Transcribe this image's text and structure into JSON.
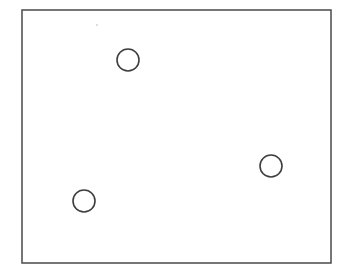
{
  "figure": {
    "name": "rectangle-with-three-circles",
    "canvas": {
      "width": 348,
      "height": 276,
      "background_color": "#ffffff"
    },
    "frame": {
      "name": "outer-rectangle",
      "shape": "rectangle",
      "x": 22,
      "y": 10,
      "width": 309,
      "height": 253,
      "stroke_color": "#4a4a4a",
      "stroke_width": 1.5,
      "fill_color": "none"
    },
    "circles": [
      {
        "id": "circle-top",
        "label": "top circle",
        "cx": 128,
        "cy": 60,
        "r": 11,
        "stroke_color": "#3f3f3f",
        "stroke_width": 1.6,
        "fill_color": "none"
      },
      {
        "id": "circle-right",
        "label": "right circle",
        "cx": 271,
        "cy": 166,
        "r": 11,
        "stroke_color": "#3f3f3f",
        "stroke_width": 1.6,
        "fill_color": "none"
      },
      {
        "id": "circle-bottom-left",
        "label": "bottom left circle",
        "cx": 84,
        "cy": 201,
        "r": 11,
        "stroke_color": "#3f3f3f",
        "stroke_width": 1.6,
        "fill_color": "none"
      }
    ],
    "marks": [
      {
        "id": "speck-top",
        "label": "faint speck",
        "cx": 97,
        "cy": 25,
        "r": 0.9,
        "fill_color": "#cfcfcf"
      }
    ],
    "counts": {
      "circle_count": 3,
      "rectangle_count": 1
    }
  }
}
